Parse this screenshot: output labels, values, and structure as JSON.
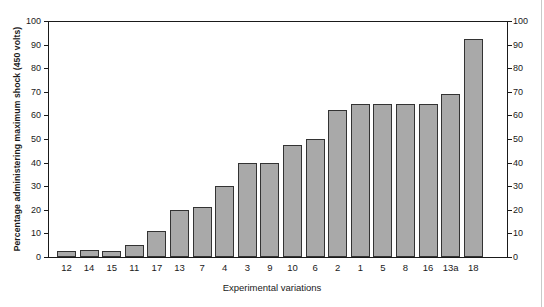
{
  "chart_data": {
    "type": "bar",
    "title": "",
    "xlabel": "Experimental variations",
    "ylabel": "Percentage administering maximum shock (450 volts)",
    "categories": [
      "12",
      "14",
      "15",
      "11",
      "17",
      "13",
      "7",
      "4",
      "3",
      "9",
      "10",
      "6",
      "2",
      "1",
      "5",
      "8",
      "16",
      "13a",
      "18"
    ],
    "values": [
      2.5,
      3,
      2.5,
      5,
      11,
      20,
      21,
      30,
      40,
      40,
      47.5,
      50,
      62.5,
      65,
      65,
      65,
      65,
      69,
      92.5
    ],
    "ylim": [
      0,
      100
    ],
    "ytick_labels": [
      "0",
      "10",
      "20",
      "30",
      "40",
      "50",
      "60",
      "70",
      "80",
      "90",
      "100"
    ],
    "ytick_values": [
      0,
      10,
      20,
      30,
      40,
      50,
      60,
      70,
      80,
      90,
      100
    ],
    "right_axis": {
      "ylim": [
        0,
        100
      ],
      "ytick_labels": [
        "0",
        "10",
        "20",
        "30",
        "40",
        "50",
        "60",
        "70",
        "80",
        "90",
        "100"
      ]
    },
    "grid": false,
    "legend": null,
    "bar_color": "#a9a9a9",
    "bar_edge_color": "#333333",
    "axis_color": "#1a1a1a",
    "background": "#ffffff"
  }
}
